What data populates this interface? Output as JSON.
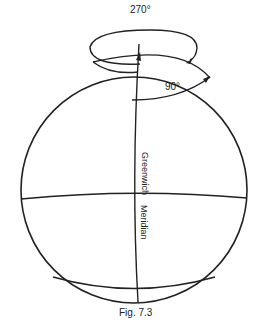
{
  "figure": {
    "caption": "Fig. 7.3",
    "labels": {
      "angle_top": "270°",
      "angle_right": "90°",
      "meridian_upper": "Greenwich",
      "meridian_lower": "Meridian"
    },
    "colors": {
      "stroke": "#222222",
      "background": "#ffffff"
    }
  }
}
